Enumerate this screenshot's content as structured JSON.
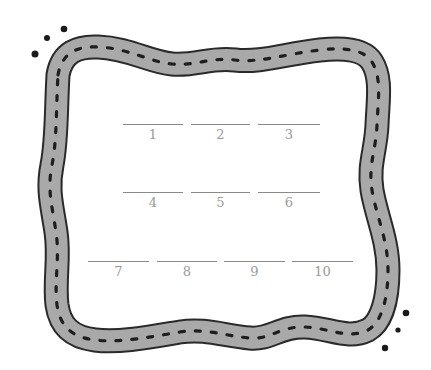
{
  "colors": {
    "frame_fill": "#a8a8a8",
    "frame_outline": "#2a2a2a",
    "frame_dash": "#1e1e1e",
    "dot": "#1a1a1a",
    "blank_line": "#8a8a8a",
    "blank_label": "#9a9a9a"
  },
  "frame": {
    "icon": "wavy-dashed-border-frame"
  },
  "decorations": {
    "top_left_dots": 3,
    "bottom_right_dots": 3
  },
  "blanks": [
    {
      "label": "1"
    },
    {
      "label": "2"
    },
    {
      "label": "3"
    },
    {
      "label": "4"
    },
    {
      "label": "5"
    },
    {
      "label": "6"
    },
    {
      "label": "7"
    },
    {
      "label": "8"
    },
    {
      "label": "9"
    },
    {
      "label": "10"
    }
  ]
}
